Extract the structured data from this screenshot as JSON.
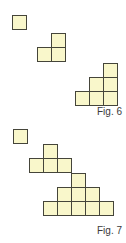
{
  "page": {
    "background": "#ffffff"
  },
  "style": {
    "square_fill": "#F9F7CB",
    "square_border": "#45453A",
    "caption_color": "#3A3A3A"
  },
  "unit_px": 14,
  "figures": [
    {
      "id": "figure-6",
      "caption": "Fig. 6",
      "shapes": [
        {
          "name": "pattern-term-1",
          "squares": 1,
          "origin": {
            "x": 12,
            "y": 15
          },
          "cells": [
            [
              0,
              0
            ]
          ]
        },
        {
          "name": "pattern-term-2",
          "squares": 3,
          "origin": {
            "x": 37,
            "y": 33
          },
          "cells": [
            [
              1,
              0
            ],
            [
              0,
              1
            ],
            [
              1,
              1
            ]
          ]
        },
        {
          "name": "pattern-term-3",
          "squares": 6,
          "origin": {
            "x": 75,
            "y": 63
          },
          "cells": [
            [
              2,
              0
            ],
            [
              1,
              1
            ],
            [
              2,
              1
            ],
            [
              0,
              2
            ],
            [
              1,
              2
            ],
            [
              2,
              2
            ]
          ]
        }
      ]
    },
    {
      "id": "figure-7",
      "caption": "Fig. 7",
      "shapes": [
        {
          "name": "pattern-term-1",
          "squares": 1,
          "origin": {
            "x": 13,
            "y": 129
          },
          "cells": [
            [
              0,
              0
            ]
          ]
        },
        {
          "name": "pattern-term-2",
          "squares": 4,
          "origin": {
            "x": 29,
            "y": 144
          },
          "cells": [
            [
              1,
              0
            ],
            [
              0,
              1
            ],
            [
              1,
              1
            ],
            [
              2,
              1
            ]
          ]
        },
        {
          "name": "pattern-term-3",
          "squares": 9,
          "origin": {
            "x": 43,
            "y": 173
          },
          "cells": [
            [
              2,
              0
            ],
            [
              1,
              1
            ],
            [
              2,
              1
            ],
            [
              3,
              1
            ],
            [
              0,
              2
            ],
            [
              1,
              2
            ],
            [
              2,
              2
            ],
            [
              3,
              2
            ],
            [
              4,
              2
            ]
          ]
        }
      ]
    }
  ]
}
